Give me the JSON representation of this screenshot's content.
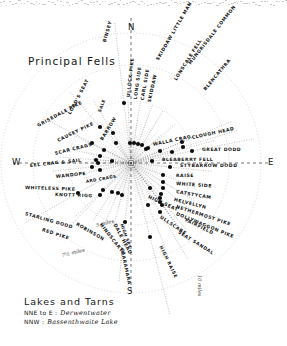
{
  "page": {
    "title": "Principal Fells",
    "center_label": "viewpoint-hub"
  },
  "cardinals": [
    {
      "name": "north",
      "text": "N",
      "x": 128,
      "y": 22
    },
    {
      "name": "west",
      "text": "W",
      "x": 12,
      "y": 157
    },
    {
      "name": "east",
      "text": "E",
      "x": 268,
      "y": 157
    },
    {
      "name": "south",
      "text": "S",
      "x": 127,
      "y": 286
    }
  ],
  "scale_rings": [
    {
      "name": "ring-5-miles",
      "text": "5 miles",
      "x": 96,
      "y": 222,
      "rot": -14,
      "r": 62
    },
    {
      "name": "ring-7-half-miles",
      "text": "7½ miles",
      "x": 62,
      "y": 252,
      "rot": -14,
      "r": 98
    },
    {
      "name": "ring-10-miles",
      "text": "10 miles",
      "x": 200,
      "y": 272,
      "rot": 90,
      "r": 130
    }
  ],
  "legend": {
    "title": "Lakes and Tarns",
    "rows": [
      {
        "name": "legend-row-derwentwater",
        "bearing": "NNE to E :",
        "value": "Derwentwater"
      },
      {
        "name": "legend-row-bassenthwaite",
        "bearing": "NNW :",
        "value": "Bassenthwaite Lake"
      }
    ]
  },
  "fells": [
    {
      "name": "binsey",
      "label": "BINSEY",
      "x": 105,
      "y": 40,
      "rot": -74,
      "dot": [
        124,
        103
      ],
      "ray": 82,
      "sm": false
    },
    {
      "name": "ullock-pike",
      "label": "ULLOCK PIKE",
      "x": 129,
      "y": 95,
      "rot": -84,
      "dot": [
        130,
        143
      ],
      "ray": 42,
      "sm": false
    },
    {
      "name": "long-side",
      "label": "LONG SIDE",
      "x": 136,
      "y": 97,
      "rot": -82,
      "dot": [
        134,
        143
      ],
      "ray": 42,
      "sm": false
    },
    {
      "name": "carl-side",
      "label": "CARL SIDE",
      "x": 143,
      "y": 98,
      "rot": -80,
      "dot": [
        138,
        144
      ],
      "ray": 41,
      "sm": false
    },
    {
      "name": "skiddaw",
      "label": "SKIDDAW",
      "x": 150,
      "y": 100,
      "rot": -78,
      "dot": [
        142,
        145
      ],
      "ray": 40,
      "sm": false
    },
    {
      "name": "skiddaw-little-man",
      "label": "SKIDDAW LITTLE MAN",
      "x": 158,
      "y": 58,
      "rot": -60,
      "dot": [
        148,
        148
      ],
      "ray": 36,
      "sm": false
    },
    {
      "name": "lonscale-fell",
      "label": "LONSCALE FELL",
      "x": 176,
      "y": 78,
      "rot": -58,
      "dot": [
        160,
        151
      ],
      "ray": 34,
      "sm": false
    },
    {
      "name": "mungrisdale-common",
      "label": "MUNGRISDALE COMMON",
      "x": 190,
      "y": 62,
      "rot": -52,
      "dot": [
        172,
        152
      ],
      "ray": 45,
      "sm": false
    },
    {
      "name": "blencathra",
      "label": "BLENCATHRA",
      "x": 205,
      "y": 88,
      "rot": -50,
      "dot": [
        183,
        147
      ],
      "ray": 58,
      "sm": false
    },
    {
      "name": "lords-seat",
      "label": "LORD'S SEAT",
      "x": 70,
      "y": 112,
      "rot": -62,
      "dot": [
        100,
        127
      ],
      "ray": 47,
      "sm": false
    },
    {
      "name": "sale-fell",
      "label": "SALE",
      "x": 100,
      "y": 110,
      "rot": -70,
      "dot": [
        113,
        133
      ],
      "ray": 38,
      "sm": true
    },
    {
      "name": "barrow",
      "label": "BARROW",
      "x": 102,
      "y": 138,
      "rot": -58,
      "dot": [
        116,
        143
      ],
      "ray": 27,
      "sm": false
    },
    {
      "name": "grisedale-pike",
      "label": "GRISEDALE PIKE",
      "x": 38,
      "y": 124,
      "rot": -28,
      "dot": [
        92,
        143
      ],
      "ray": 48,
      "sm": false
    },
    {
      "name": "causey-pike",
      "label": "CAUSEY PIKE",
      "x": 58,
      "y": 139,
      "rot": -26,
      "dot": [
        104,
        150
      ],
      "ray": 31,
      "sm": false
    },
    {
      "name": "scar-crags",
      "label": "SCAR CRAGS",
      "x": 55,
      "y": 152,
      "rot": -14,
      "dot": [
        100,
        156
      ],
      "ray": 32,
      "sm": false
    },
    {
      "name": "eel-crag-and-sail",
      "label": "EEL CRAG & SAIL",
      "x": 30,
      "y": 164,
      "rot": -6,
      "dot": [
        96,
        160
      ],
      "ray": 36,
      "sm": false
    },
    {
      "name": "wandope",
      "label": "WANDOPE",
      "x": 56,
      "y": 175,
      "rot": -6,
      "dot": [
        98,
        163
      ],
      "ray": 34,
      "sm": false
    },
    {
      "name": "ard-crags",
      "label": "ARD CRAGS",
      "x": 86,
      "y": 180,
      "rot": -10,
      "dot": [
        112,
        161
      ],
      "ray": 21,
      "sm": true
    },
    {
      "name": "whiteless-pike",
      "label": "WHITELESS PIKE",
      "x": 25,
      "y": 186,
      "rot": 2,
      "dot": [
        92,
        167
      ],
      "ray": 40,
      "sm": false
    },
    {
      "name": "knott-rigg",
      "label": "KNOTT RIGG",
      "x": 55,
      "y": 193,
      "rot": 2,
      "dot": [
        100,
        170
      ],
      "ray": 32,
      "sm": false
    },
    {
      "name": "starling-dodd",
      "label": "STARLING DODD",
      "x": 25,
      "y": 212,
      "rot": 16,
      "dot": [
        78,
        193
      ],
      "ray": 60,
      "sm": false
    },
    {
      "name": "red-pike",
      "label": "RED PIKE",
      "x": 42,
      "y": 228,
      "rot": 18,
      "dot": [
        100,
        195
      ],
      "ray": 47,
      "sm": false
    },
    {
      "name": "robinson",
      "label": "ROBINSON",
      "x": 76,
      "y": 222,
      "rot": 30,
      "dot": [
        103,
        190
      ],
      "ray": 39,
      "sm": false
    },
    {
      "name": "hindscarth",
      "label": "HINDSCARTH",
      "x": 100,
      "y": 222,
      "rot": 52,
      "dot": [
        112,
        192
      ],
      "ray": 34,
      "sm": false
    },
    {
      "name": "dale-head",
      "label": "DALE HEAD",
      "x": 114,
      "y": 222,
      "rot": 62,
      "dot": [
        118,
        193
      ],
      "ray": 33,
      "sm": false
    },
    {
      "name": "high-spy",
      "label": "HIGH SPY",
      "x": 121,
      "y": 222,
      "rot": 70,
      "dot": [
        122,
        195
      ],
      "ray": 33,
      "sm": true
    },
    {
      "name": "glaramara",
      "label": "GLARAMARA",
      "x": 121,
      "y": 246,
      "rot": 78,
      "dot": [
        125,
        222
      ],
      "ray": 60,
      "sm": false
    },
    {
      "name": "high-raise",
      "label": "HIGH RAISE",
      "x": 160,
      "y": 244,
      "rot": 64,
      "dot": [
        150,
        237
      ],
      "ray": 80,
      "sm": false
    },
    {
      "name": "ullscarf",
      "label": "ULLSCARF",
      "x": 160,
      "y": 215,
      "rot": 34,
      "dot": [
        148,
        205
      ],
      "ray": 48,
      "sm": false
    },
    {
      "name": "high-seat",
      "label": "HIGH SEAT",
      "x": 148,
      "y": 195,
      "rot": 24,
      "dot": [
        150,
        188
      ],
      "ray": 32,
      "sm": false
    },
    {
      "name": "seat-sandal",
      "label": "SEAT SANDAL",
      "x": 178,
      "y": 230,
      "rot": 32,
      "dot": [
        160,
        212
      ],
      "ray": 55,
      "sm": false
    },
    {
      "name": "fairfield",
      "label": "FAIRFIELD",
      "x": 185,
      "y": 218,
      "rot": 26,
      "dot": [
        162,
        205
      ],
      "ray": 48,
      "sm": false
    },
    {
      "name": "dollywaggon-pike",
      "label": "DOLLYWAGGON PIKE",
      "x": 176,
      "y": 212,
      "rot": 22,
      "dot": [
        160,
        202
      ],
      "ray": 44,
      "sm": false
    },
    {
      "name": "nethermost-pike",
      "label": "NETHERMOST PIKE",
      "x": 176,
      "y": 205,
      "rot": 18,
      "dot": [
        160,
        198
      ],
      "ray": 42,
      "sm": false
    },
    {
      "name": "helvellyn",
      "label": "HELVELLYN",
      "x": 174,
      "y": 198,
      "rot": 14,
      "dot": [
        161,
        194
      ],
      "ray": 39,
      "sm": false
    },
    {
      "name": "catstycam",
      "label": "CATSTYCAM",
      "x": 176,
      "y": 190,
      "rot": 10,
      "dot": [
        163,
        188
      ],
      "ray": 38,
      "sm": false
    },
    {
      "name": "white-side",
      "label": "WHITE SIDE",
      "x": 176,
      "y": 182,
      "rot": 4,
      "dot": [
        163,
        182
      ],
      "ray": 37,
      "sm": false
    },
    {
      "name": "raise",
      "label": "RAISE",
      "x": 176,
      "y": 174,
      "rot": 0,
      "dot": [
        163,
        175
      ],
      "ray": 35,
      "sm": false
    },
    {
      "name": "stybarrow-dodd",
      "label": "STYBARROW DODD",
      "x": 180,
      "y": 164,
      "rot": 0,
      "dot": [
        170,
        167
      ],
      "ray": 42,
      "sm": false
    },
    {
      "name": "bleaberry-fell",
      "label": "BLEABERRY FELL",
      "x": 162,
      "y": 158,
      "rot": 0,
      "dot": [
        152,
        161
      ],
      "ray": 24,
      "sm": false
    },
    {
      "name": "great-dodd",
      "label": "GREAT DODD",
      "x": 202,
      "y": 148,
      "rot": 0,
      "dot": [
        192,
        151
      ],
      "ray": 63,
      "sm": false
    },
    {
      "name": "clough-head",
      "label": "CLOUGH HEAD",
      "x": 192,
      "y": 136,
      "rot": -12,
      "dot": [
        182,
        142
      ],
      "ray": 55,
      "sm": false
    },
    {
      "name": "walla-crag",
      "label": "WALLA CRAG",
      "x": 153,
      "y": 143,
      "rot": -12,
      "dot": [
        146,
        149
      ],
      "ray": 20,
      "sm": false
    }
  ]
}
